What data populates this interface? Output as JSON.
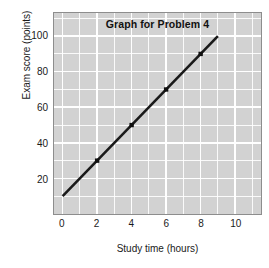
{
  "chart_data": {
    "type": "line",
    "title": "Graph for Problem 4",
    "xlabel": "Study time (hours)",
    "ylabel": "Exam score (points)",
    "xlim": [
      -0.5,
      11.5
    ],
    "ylim": [
      0,
      113
    ],
    "xticks": [
      0,
      2,
      4,
      6,
      8,
      10
    ],
    "xtick_labels": [
      "0",
      "2",
      "4",
      "6",
      "8",
      "10"
    ],
    "yticks": [
      20,
      40,
      60,
      80,
      100
    ],
    "ytick_labels": [
      "20",
      "40",
      "60",
      "80",
      "100"
    ],
    "grid": true,
    "grid_color": "#ffffff",
    "plot_background": "#d2d2d2",
    "legend": null,
    "series": [
      {
        "name": "Exam score vs study time",
        "line_color": "#1a1a1a",
        "marker": "square",
        "marker_color": "#111111",
        "line_start": {
          "x": 0,
          "y": 10
        },
        "line_end": {
          "x": 9,
          "y": 100
        },
        "slope": 10,
        "intercept": 10,
        "x": [
          2,
          4,
          6,
          8
        ],
        "values": [
          30,
          50,
          70,
          90
        ],
        "points": [
          {
            "x": 2,
            "y": 30
          },
          {
            "x": 4,
            "y": 50
          },
          {
            "x": 6,
            "y": 70
          },
          {
            "x": 8,
            "y": 90
          }
        ]
      }
    ]
  }
}
